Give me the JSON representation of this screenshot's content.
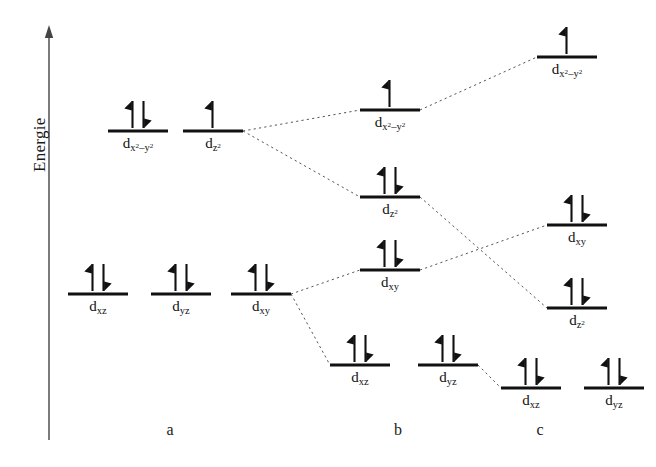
{
  "figure": {
    "type": "orbital-energy-level-diagram",
    "axis": {
      "label": "Energie",
      "direction": "up",
      "x": 49,
      "y_top": 25,
      "y_bottom": 440
    },
    "colors": {
      "level_line": "#111111",
      "arrow": "#111111",
      "connector": "#555555",
      "axis": "#444444",
      "text": "#111111",
      "background": "#ffffff"
    },
    "level_width": 60,
    "columns": [
      {
        "id": "a",
        "label": "a",
        "label_x": 170,
        "label_y": 431
      },
      {
        "id": "b",
        "label": "b",
        "label_x": 398,
        "label_y": 431
      },
      {
        "id": "c",
        "label": "c",
        "label_x": 540,
        "label_y": 431
      }
    ],
    "levels": [
      {
        "id": "a-dx2y2",
        "column": "a",
        "orbital": "d",
        "sub": "x",
        "sub_sup": "2",
        "sub_tail": "–y",
        "sub_tail_sup": "2",
        "label_html": "d<sub>x<sup>2</sup>–y<sup>2</sup></sub>",
        "x": 108,
        "y": 131,
        "electrons": "up-down"
      },
      {
        "id": "a-dz2",
        "column": "a",
        "label_html": "d<sub>z<sup>2</sup></sub>",
        "x": 183,
        "y": 131,
        "electrons": "up"
      },
      {
        "id": "a-dxz",
        "column": "a",
        "label_html": "d<sub>xz</sub>",
        "x": 68,
        "y": 294,
        "electrons": "up-down"
      },
      {
        "id": "a-dyz",
        "column": "a",
        "label_html": "d<sub>yz</sub>",
        "x": 151,
        "y": 294,
        "electrons": "up-down"
      },
      {
        "id": "a-dxy",
        "column": "a",
        "label_html": "d<sub>xy</sub>",
        "x": 231,
        "y": 294,
        "electrons": "up-down"
      },
      {
        "id": "b-dx2y2",
        "column": "b",
        "label_html": "d<sub>x<sup>2</sup>–y<sup>2</sup></sub>",
        "x": 360,
        "y": 110,
        "electrons": "up"
      },
      {
        "id": "b-dz2",
        "column": "b",
        "label_html": "d<sub>z<sup>2</sup></sub>",
        "x": 360,
        "y": 197,
        "electrons": "up-down"
      },
      {
        "id": "b-dxy",
        "column": "b",
        "label_html": "d<sub>xy</sub>",
        "x": 360,
        "y": 270,
        "electrons": "up-down"
      },
      {
        "id": "b-dxz",
        "column": "b",
        "label_html": "d<sub>xz</sub>",
        "x": 330,
        "y": 365,
        "electrons": "up-down"
      },
      {
        "id": "b-dyz",
        "column": "b",
        "label_html": "d<sub>yz</sub>",
        "x": 418,
        "y": 365,
        "electrons": "up-down"
      },
      {
        "id": "c-dx2y2",
        "column": "c",
        "label_html": "d<sub>x<sup>2</sup>–y<sup>2</sup></sub>",
        "x": 537,
        "y": 57,
        "electrons": "up"
      },
      {
        "id": "c-dxy",
        "column": "c",
        "label_html": "d<sub>xy</sub>",
        "x": 547,
        "y": 225,
        "electrons": "up-down"
      },
      {
        "id": "c-dz2",
        "column": "c",
        "label_html": "d<sub>z<sup>2</sup></sub>",
        "x": 547,
        "y": 308,
        "electrons": "up-down"
      },
      {
        "id": "c-dxz",
        "column": "c",
        "label_html": "d<sub>xz</sub>",
        "x": 501,
        "y": 388,
        "electrons": "up-down"
      },
      {
        "id": "c-dyz",
        "column": "c",
        "label_html": "d<sub>yz</sub>",
        "x": 584,
        "y": 388,
        "electrons": "up-down"
      }
    ],
    "connectors": [
      {
        "id": "a-dz2__b-dx2y2",
        "x1": 243,
        "y1": 131,
        "x2": 360,
        "y2": 110
      },
      {
        "id": "a-dz2__b-dz2",
        "x1": 243,
        "y1": 131,
        "x2": 360,
        "y2": 197
      },
      {
        "id": "a-dxy__b-dxy",
        "x1": 291,
        "y1": 294,
        "x2": 360,
        "y2": 270
      },
      {
        "id": "a-dxy__b-dxz",
        "x1": 291,
        "y1": 294,
        "x2": 330,
        "y2": 365
      },
      {
        "id": "b-dx2y2__c-dx2y2",
        "x1": 420,
        "y1": 110,
        "x2": 537,
        "y2": 57
      },
      {
        "id": "b-dz2__c-dz2",
        "x1": 420,
        "y1": 197,
        "x2": 547,
        "y2": 308
      },
      {
        "id": "b-dxy__c-dxy",
        "x1": 420,
        "y1": 270,
        "x2": 547,
        "y2": 225
      },
      {
        "id": "b-dyz__c-dxz",
        "x1": 478,
        "y1": 365,
        "x2": 501,
        "y2": 388
      }
    ]
  }
}
